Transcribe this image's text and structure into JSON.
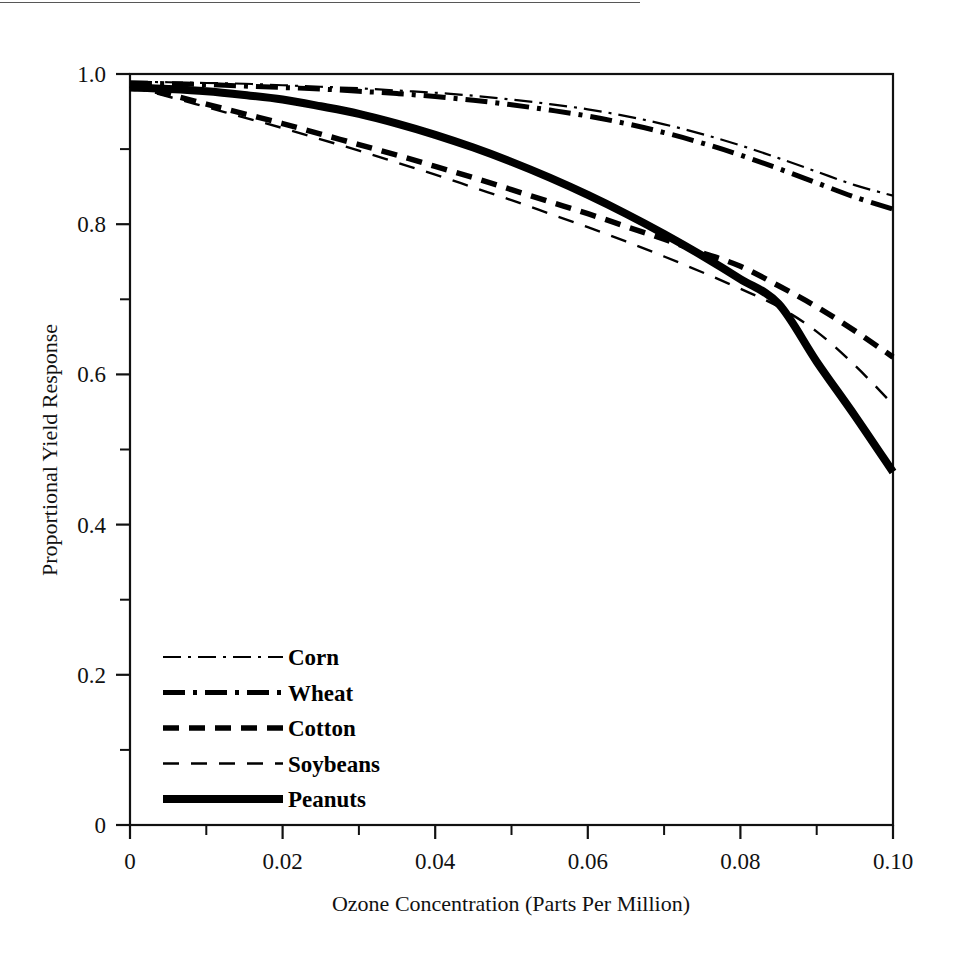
{
  "figure": {
    "background": "#ffffff",
    "ink_color": "#000000",
    "has_top_scan_rule": true
  },
  "chart_data": {
    "type": "line",
    "title": "",
    "subtitle": "",
    "xlabel": "Ozone Concentration (Parts Per Million)",
    "ylabel": "Proportional Yield Response",
    "xlim": [
      0,
      0.1
    ],
    "ylim": [
      0,
      1.0
    ],
    "x_major_ticks": [
      0,
      0.02,
      0.04,
      0.06,
      0.08,
      0.1
    ],
    "x_major_tick_labels": [
      "0",
      "0.02",
      "0.04",
      "0.06",
      "0.08",
      "0.10"
    ],
    "x_minor_ticks": [
      0.01,
      0.03,
      0.05,
      0.07,
      0.09
    ],
    "y_major_ticks": [
      0,
      0.2,
      0.4,
      0.6,
      0.8,
      1.0
    ],
    "y_major_tick_labels": [
      "0",
      "0.2",
      "0.4",
      "0.6",
      "0.8",
      "1.0"
    ],
    "y_minor_ticks": [
      0.1,
      0.3,
      0.5,
      0.7,
      0.9
    ],
    "grid": false,
    "legend_position": "lower-left-inside",
    "x": [
      0,
      0.005,
      0.01,
      0.015,
      0.02,
      0.025,
      0.03,
      0.035,
      0.04,
      0.045,
      0.05,
      0.055,
      0.06,
      0.065,
      0.07,
      0.075,
      0.08,
      0.085,
      0.09,
      0.095,
      0.1
    ],
    "series": [
      {
        "name": "Corn",
        "style": "thin-dash-dot",
        "stroke_width": 2.2,
        "dash_pattern": "18,7,3,7",
        "values": [
          0.99,
          0.989,
          0.988,
          0.987,
          0.985,
          0.983,
          0.981,
          0.978,
          0.975,
          0.971,
          0.966,
          0.96,
          0.953,
          0.944,
          0.933,
          0.92,
          0.905,
          0.888,
          0.87,
          0.852,
          0.838
        ]
      },
      {
        "name": "Wheat",
        "style": "thick-dash-dot",
        "stroke_width": 5.0,
        "dash_pattern": "22,8,4,8",
        "values": [
          0.988,
          0.987,
          0.986,
          0.984,
          0.982,
          0.98,
          0.977,
          0.974,
          0.97,
          0.965,
          0.959,
          0.952,
          0.944,
          0.934,
          0.922,
          0.908,
          0.892,
          0.874,
          0.855,
          0.836,
          0.82
        ]
      },
      {
        "name": "Cotton",
        "style": "thick-dash",
        "stroke_width": 5.5,
        "dash_pattern": "16,10",
        "values": [
          0.985,
          0.973,
          0.96,
          0.947,
          0.934,
          0.92,
          0.906,
          0.892,
          0.877,
          0.862,
          0.846,
          0.83,
          0.814,
          0.797,
          0.78,
          0.762,
          0.744,
          0.718,
          0.69,
          0.658,
          0.623
        ]
      },
      {
        "name": "Soybeans",
        "style": "thin-dash",
        "stroke_width": 2.4,
        "dash_pattern": "16,12",
        "values": [
          0.983,
          0.97,
          0.956,
          0.942,
          0.928,
          0.913,
          0.898,
          0.882,
          0.866,
          0.849,
          0.832,
          0.814,
          0.796,
          0.777,
          0.757,
          0.736,
          0.714,
          0.69,
          0.657,
          0.612,
          0.56
        ]
      },
      {
        "name": "Peanuts",
        "style": "thick-solid",
        "stroke_width": 8.0,
        "dash_pattern": "",
        "values": [
          0.982,
          0.98,
          0.977,
          0.972,
          0.966,
          0.957,
          0.947,
          0.934,
          0.919,
          0.902,
          0.883,
          0.862,
          0.839,
          0.814,
          0.787,
          0.758,
          0.727,
          0.694,
          0.617,
          0.545,
          0.47
        ]
      }
    ]
  },
  "legend": {
    "entries": [
      {
        "label": "Corn",
        "sample": "thin-dash-dot"
      },
      {
        "label": "Wheat",
        "sample": "thick-dash-dot"
      },
      {
        "label": "Cotton",
        "sample": "thick-dash"
      },
      {
        "label": "Soybeans",
        "sample": "thin-dash"
      },
      {
        "label": "Peanuts",
        "sample": "thick-solid"
      }
    ]
  }
}
